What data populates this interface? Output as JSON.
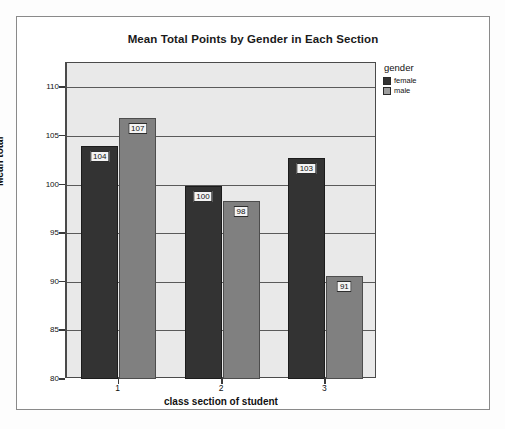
{
  "chart_data": {
    "type": "bar",
    "title": "Mean Total Points by Gender in Each Section",
    "xlabel": "class section of student",
    "ylabel": "Mean total",
    "categories": [
      "1",
      "2",
      "3"
    ],
    "ylim": [
      80,
      112.5
    ],
    "yticks": [
      80,
      85,
      90,
      95,
      100,
      105,
      110
    ],
    "ytick_labels": [
      "80",
      "85",
      "90",
      "95",
      "100",
      "105",
      "110"
    ],
    "grid": true,
    "legend_title": "gender",
    "legend_position": "right",
    "series": [
      {
        "name": "female",
        "color": "#333333",
        "values": [
          104.0,
          99.9,
          102.7
        ],
        "data_labels": [
          "104",
          "100",
          "103"
        ]
      },
      {
        "name": "male",
        "color": "#808080",
        "values": [
          106.8,
          98.3,
          90.6
        ],
        "data_labels": [
          "107",
          "98",
          "91"
        ]
      }
    ]
  },
  "legend": {
    "title": "gender",
    "items": [
      {
        "label": "female",
        "color": "#333333"
      },
      {
        "label": "male",
        "color": "#9d9d9d"
      }
    ]
  },
  "colors": {
    "female_bar": "#333333",
    "male_bar": "#808080",
    "plot_background": "#e9e9e9",
    "gridline": "#5a5a5a",
    "frame": "#4a4a4a",
    "page_background": "#ffffff"
  }
}
